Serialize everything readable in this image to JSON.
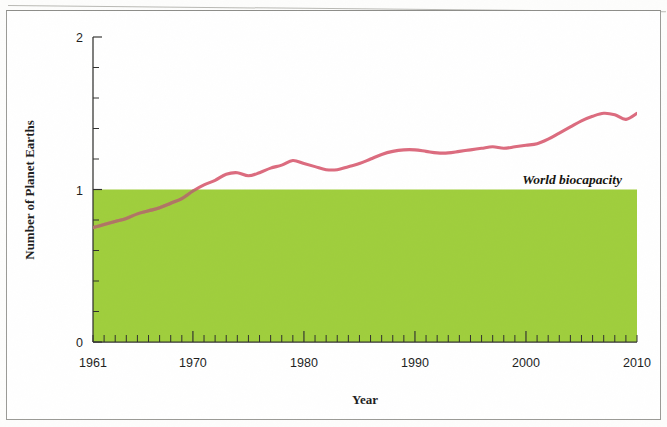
{
  "chart_data": {
    "type": "line",
    "title": "",
    "xlabel": "Year",
    "ylabel": "Number of Planet Earths",
    "xlim": [
      1961,
      2010
    ],
    "ylim": [
      0,
      2
    ],
    "grid": false,
    "legend_position": "none",
    "x_ticks": [
      "1961",
      "1970",
      "1980",
      "1990",
      "2000",
      "2010"
    ],
    "x_tick_values": [
      1961,
      1970,
      1980,
      1990,
      2000,
      2010
    ],
    "y_ticks": [
      "0",
      "1",
      "2"
    ],
    "y_tick_values": [
      0,
      1,
      2
    ],
    "y_minor_step": 0.2,
    "annotations": [
      {
        "text": "World biocapacity",
        "x": 2002,
        "y": 1.04,
        "style": "bold-italic"
      }
    ],
    "bands": [
      {
        "name": "World biocapacity",
        "from": 0,
        "to": 1,
        "color": "#9fce3c"
      }
    ],
    "series": [
      {
        "name": "Humanity's Ecological Footprint",
        "color": "#dc6b7e",
        "x": [
          1961,
          1962,
          1963,
          1964,
          1965,
          1966,
          1967,
          1968,
          1969,
          1970,
          1971,
          1972,
          1973,
          1974,
          1975,
          1976,
          1977,
          1978,
          1979,
          1980,
          1981,
          1982,
          1983,
          1984,
          1985,
          1986,
          1987,
          1988,
          1989,
          1990,
          1991,
          1992,
          1993,
          1994,
          1995,
          1996,
          1997,
          1998,
          1999,
          2000,
          2001,
          2002,
          2003,
          2004,
          2005,
          2006,
          2007,
          2008,
          2009,
          2010
        ],
        "values": [
          0.75,
          0.77,
          0.79,
          0.81,
          0.84,
          0.86,
          0.88,
          0.91,
          0.94,
          0.99,
          1.03,
          1.06,
          1.1,
          1.11,
          1.09,
          1.11,
          1.14,
          1.16,
          1.19,
          1.17,
          1.15,
          1.13,
          1.13,
          1.15,
          1.17,
          1.2,
          1.23,
          1.25,
          1.26,
          1.26,
          1.25,
          1.24,
          1.24,
          1.25,
          1.26,
          1.27,
          1.28,
          1.27,
          1.28,
          1.29,
          1.3,
          1.33,
          1.37,
          1.41,
          1.45,
          1.48,
          1.5,
          1.49,
          1.46,
          1.5
        ]
      }
    ]
  },
  "colors": {
    "line": "#dc6b7e",
    "band": "#9fce3c",
    "axis": "#30302e",
    "text": "#1d1d1d"
  }
}
